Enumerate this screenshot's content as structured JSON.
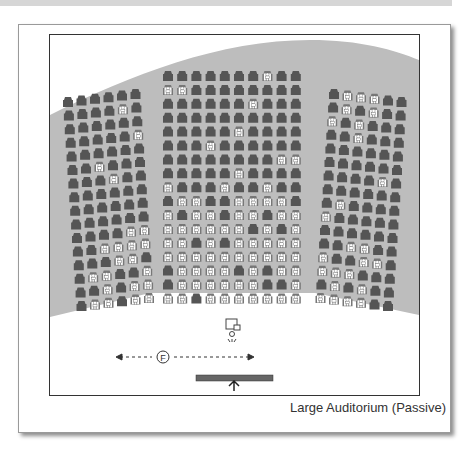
{
  "figure": {
    "caption": "Large Auditorium (Passive)",
    "fire_exit_label": "F"
  },
  "colors": {
    "floor": "#bdbdbd",
    "seat_empty": "#555555",
    "seat_occupied_fill": "#ffffff",
    "frame_border": "#333333",
    "stage": "#666666"
  },
  "legend": {
    "seat_empty": "empty seat (dark chair)",
    "seat_occupied": "occupied seat (white person)"
  },
  "sections": {
    "left": {
      "cols": 6,
      "rows": [
        "000000",
        "000010",
        "000000",
        "000001",
        "000000",
        "001000",
        "000100",
        "000000",
        "000000",
        "000000",
        "000011",
        "001111",
        "000110",
        "011001",
        "001011",
        "011011"
      ]
    },
    "center": {
      "cols": 10,
      "rows": [
        "0000000100",
        "1100000000",
        "0000001000",
        "0000000000",
        "0000010000",
        "0001000000",
        "0000000011",
        "0000010000",
        "1000100100",
        "0110011110",
        "1011011011",
        "1111110101",
        "1101011111",
        "1111111111",
        "0111101011",
        "0111111001",
        "1101111111"
      ]
    },
    "right": {
      "cols": 6,
      "rows": [
        "011100",
        "010100",
        "101000",
        "001000",
        "000000",
        "000000",
        "000010",
        "000000",
        "010000",
        "100000",
        "000000",
        "001100",
        "100110",
        "111000",
        "010100",
        "111100"
      ]
    }
  },
  "annotations": {
    "camera": "presenter-camera",
    "arrow": "bidirectional-dashed-arrow",
    "stage": "stage-with-forward-arrow"
  }
}
